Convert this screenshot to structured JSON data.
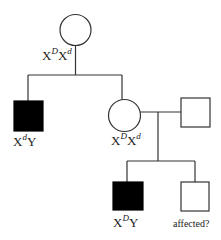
{
  "diagram": {
    "type": "pedigree",
    "stroke_color": "#333333",
    "affected_fill": "#000000",
    "unaffected_fill": "#ffffff"
  },
  "individuals": [
    {
      "id": "grandmother",
      "sex": "female",
      "affected": false,
      "genotype": {
        "base1": "X",
        "sup1": "D",
        "base2": "X",
        "sup2": "d"
      }
    },
    {
      "id": "son",
      "sex": "male",
      "affected": true,
      "genotype": {
        "base1": "X",
        "sup1": "d",
        "base2": "Y",
        "sup2": ""
      }
    },
    {
      "id": "daughter",
      "sex": "female",
      "affected": false,
      "genotype": {
        "base1": "X",
        "sup1": "D",
        "base2": "X",
        "sup2": "d"
      }
    },
    {
      "id": "daughter-spouse",
      "sex": "male",
      "affected": false,
      "genotype": null
    },
    {
      "id": "grandson-1",
      "sex": "male",
      "affected": true,
      "genotype": {
        "base1": "X",
        "sup1": "D",
        "base2": "Y",
        "sup2": ""
      }
    },
    {
      "id": "grandson-2",
      "sex": "male",
      "affected": null,
      "label": "affected?"
    }
  ],
  "labels": {
    "grandmother": {
      "b1": "X",
      "s1": "D",
      "b2": "X",
      "s2": "d"
    },
    "son": {
      "b1": "X",
      "s1": "d",
      "b2": "Y"
    },
    "daughter": {
      "b1": "X",
      "s1": "D",
      "b2": "X",
      "s2": "d"
    },
    "grandson1": {
      "b1": "X",
      "s1": "D",
      "b2": "Y"
    },
    "grandson2": "affected?"
  }
}
